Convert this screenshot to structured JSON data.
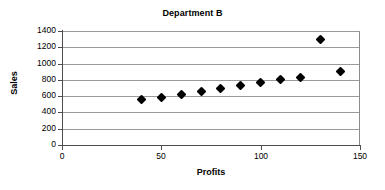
{
  "chart_data": {
    "type": "scatter",
    "title": "Department B",
    "xlabel": "Profits",
    "ylabel": "Sales",
    "xlim": [
      0,
      150
    ],
    "ylim": [
      0,
      1400
    ],
    "xticks": [
      0,
      50,
      100,
      150
    ],
    "yticks": [
      0,
      200,
      400,
      600,
      800,
      1000,
      1200,
      1400
    ],
    "grid": true,
    "legend": null,
    "marker": "diamond",
    "marker_color": "#000000",
    "x": [
      40,
      50,
      60,
      70,
      80,
      90,
      100,
      110,
      120,
      130,
      140
    ],
    "y": [
      560,
      580,
      620,
      660,
      690,
      730,
      765,
      800,
      830,
      1290,
      905
    ],
    "points": [
      {
        "x": 40,
        "y": 560
      },
      {
        "x": 50,
        "y": 580
      },
      {
        "x": 60,
        "y": 620
      },
      {
        "x": 70,
        "y": 660
      },
      {
        "x": 80,
        "y": 690
      },
      {
        "x": 90,
        "y": 730
      },
      {
        "x": 100,
        "y": 765
      },
      {
        "x": 110,
        "y": 800
      },
      {
        "x": 120,
        "y": 830
      },
      {
        "x": 130,
        "y": 1290
      },
      {
        "x": 140,
        "y": 905
      }
    ]
  },
  "axes": {
    "y_tick_labels": [
      "1400",
      "1200",
      "1000",
      "800",
      "600",
      "400",
      "200",
      "0"
    ],
    "x_tick_labels": [
      "0",
      "50",
      "100",
      "150"
    ]
  }
}
